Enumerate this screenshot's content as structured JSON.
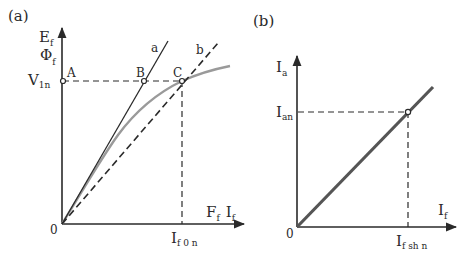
{
  "panel_a": {
    "label": "(a)",
    "y_axis_label_1": "E",
    "y_axis_label_1_sub": "f",
    "y_axis_label_2": "Φ",
    "y_axis_label_2_sub": "f",
    "y_tick_label": "V",
    "y_tick_label_sub": "1n",
    "x_axis_label_1": "F",
    "x_axis_label_1_sub": "f",
    "x_axis_label_2": "I",
    "x_axis_label_2_sub": "f",
    "x_tick_label": "I",
    "x_tick_label_sub": "f 0 n",
    "origin_label": "0",
    "points": [
      "A",
      "B",
      "C"
    ],
    "line_labels": [
      "a",
      "b"
    ],
    "curves": [
      {
        "name": "a",
        "style": "solid straight line (air-gap line)"
      },
      {
        "name": "b",
        "style": "dashed straight line through origin and C"
      },
      {
        "name": "magnetization",
        "style": "grey saturation curve"
      }
    ]
  },
  "panel_b": {
    "label": "(b)",
    "y_axis_label": "I",
    "y_axis_label_sub": "a",
    "y_tick_label": "I",
    "y_tick_label_sub": "an",
    "x_axis_label": "I",
    "x_axis_label_sub": "f",
    "x_tick_label": "I",
    "x_tick_label_sub": "f sh n",
    "origin_label": "0",
    "curves": [
      {
        "name": "Ia vs If",
        "style": "thick grey straight line through origin"
      }
    ]
  },
  "colors": {
    "ink": "#2a2a2a",
    "curve_grey": "#9a9a9a",
    "line_b_panel": "#555555",
    "background": "#ffffff"
  }
}
